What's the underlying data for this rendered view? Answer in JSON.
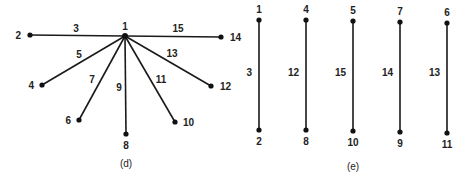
{
  "diagrams": [
    {
      "id": "d",
      "caption": "(d)",
      "type": "star-graph",
      "center_node": "1",
      "nodes": [
        "1",
        "2",
        "4",
        "6",
        "8",
        "10",
        "12",
        "14"
      ],
      "edges": [
        {
          "from": "1",
          "to": "2",
          "label": "3"
        },
        {
          "from": "1",
          "to": "4",
          "label": "5"
        },
        {
          "from": "1",
          "to": "6",
          "label": "7"
        },
        {
          "from": "1",
          "to": "8",
          "label": "9"
        },
        {
          "from": "1",
          "to": "10",
          "label": "11"
        },
        {
          "from": "1",
          "to": "12",
          "label": "13"
        },
        {
          "from": "1",
          "to": "14",
          "label": "15"
        }
      ]
    },
    {
      "id": "e",
      "caption": "(e)",
      "type": "matching",
      "edges": [
        {
          "from": "1",
          "to": "2",
          "label": "3"
        },
        {
          "from": "4",
          "to": "8",
          "label": "12"
        },
        {
          "from": "5",
          "to": "10",
          "label": "15"
        },
        {
          "from": "7",
          "to": "9",
          "label": "14"
        },
        {
          "from": "6",
          "to": "11",
          "label": "13"
        }
      ]
    }
  ]
}
